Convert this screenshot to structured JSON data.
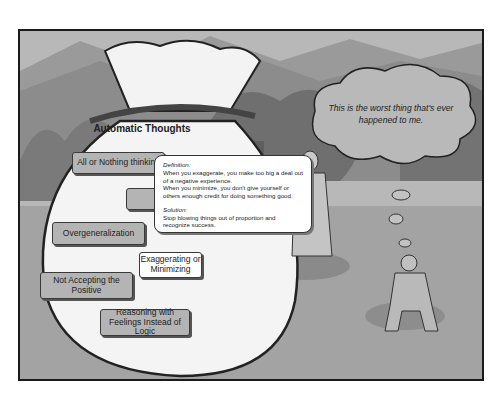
{
  "scene": {
    "bag_title": "Automatic Thoughts",
    "options": [
      {
        "label": "All or Nothing thinking",
        "active": false
      },
      {
        "label": "M",
        "active": false,
        "note": "partially hidden behind tooltip"
      },
      {
        "label": "Overgeneralization",
        "active": false
      },
      {
        "label": "Exaggerating or Minimizing",
        "active": true
      },
      {
        "label": "Not Accepting the Positive",
        "active": false
      },
      {
        "label": "Reasoning with Feelings Instead of Logic",
        "active": false
      }
    ],
    "tooltip": {
      "definition_heading": "Definition:",
      "definition_line1": "When you exaggerate, you make too big a deal out of a negative experience.",
      "definition_line2": "When you minimize, you don't give yourself or others enough credit for doing something good.",
      "solution_heading": "Solution:",
      "solution_text": "Stop blowing things out of proportion and recognize success."
    },
    "thought_bubble": "This is the worst thing that's ever happened to me."
  },
  "colors": {
    "frame_border": "#1a1a1a",
    "background": "#a9a9a9",
    "button_fill": "#b4b4b4",
    "button_active_fill": "#ffffff"
  }
}
